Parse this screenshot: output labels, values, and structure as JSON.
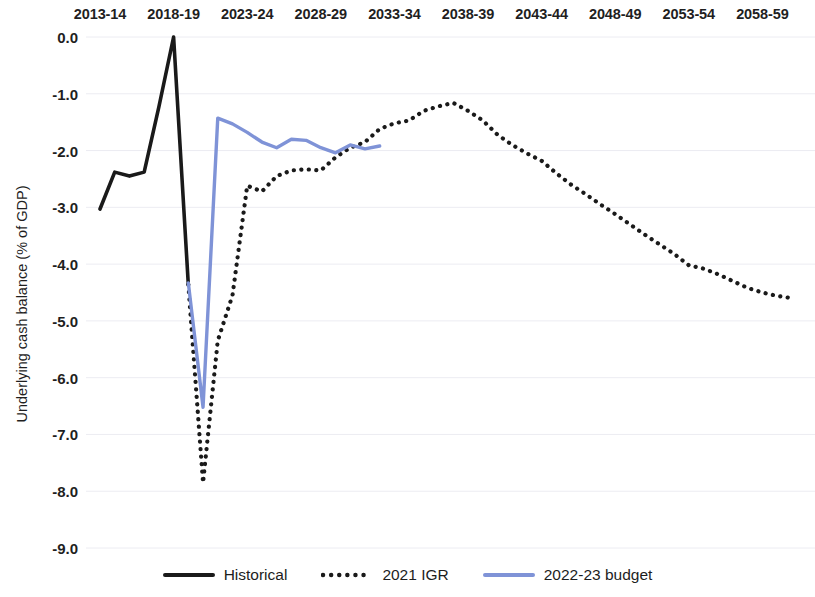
{
  "chart_data": {
    "type": "line",
    "title": "",
    "xlabel": "",
    "ylabel": "Underlying cash balance (% of GDP)",
    "ylim": [
      -9.0,
      0.0
    ],
    "xlim": [
      "2013-14",
      "2060-61"
    ],
    "grid": true,
    "legend_position": "bottom",
    "x_tick_labels": [
      "2013-14",
      "2018-19",
      "2023-24",
      "2028-29",
      "2033-34",
      "2038-39",
      "2043-44",
      "2048-49",
      "2053-54",
      "2058-59"
    ],
    "y_tick_labels": [
      "0.0",
      "-1.0",
      "-2.0",
      "-3.0",
      "-4.0",
      "-5.0",
      "-6.0",
      "-7.0",
      "-8.0",
      "-9.0"
    ],
    "y_tick_values": [
      0.0,
      -1.0,
      -2.0,
      -3.0,
      -4.0,
      -5.0,
      -6.0,
      -7.0,
      -8.0,
      -9.0
    ],
    "colors": {
      "historical": "#1a1a1a",
      "igr": "#1a1a1a",
      "budget": "#7f93d7",
      "gridline": "#ececf2",
      "text": "#1f1f1f"
    },
    "series": [
      {
        "name": "Historical",
        "style": "solid",
        "color": "#1a1a1a",
        "x": [
          "2013-14",
          "2014-15",
          "2015-16",
          "2016-17",
          "2017-18",
          "2018-19",
          "2019-20"
        ],
        "values": [
          -3.03,
          -2.38,
          -2.45,
          -2.38,
          -1.23,
          0.0,
          -4.36
        ]
      },
      {
        "name": "2021 IGR",
        "style": "dotted",
        "color": "#1a1a1a",
        "x": [
          "2019-20",
          "2020-21",
          "2021-22",
          "2022-23",
          "2023-24",
          "2024-25",
          "2025-26",
          "2026-27",
          "2027-28",
          "2028-29",
          "2029-30",
          "2030-31",
          "2031-32",
          "2032-33",
          "2033-34",
          "2034-35",
          "2035-36",
          "2036-37",
          "2037-38",
          "2038-39",
          "2039-40",
          "2040-41",
          "2041-42",
          "2042-43",
          "2043-44",
          "2044-45",
          "2045-46",
          "2046-47",
          "2047-48",
          "2048-49",
          "2049-50",
          "2050-51",
          "2051-52",
          "2052-53",
          "2053-54",
          "2054-55",
          "2055-56",
          "2056-57",
          "2057-58",
          "2058-59",
          "2059-60",
          "2060-61"
        ],
        "values": [
          -4.36,
          -7.85,
          -5.35,
          -4.55,
          -2.62,
          -2.72,
          -2.45,
          -2.35,
          -2.33,
          -2.35,
          -2.12,
          -1.95,
          -1.85,
          -1.62,
          -1.52,
          -1.47,
          -1.3,
          -1.22,
          -1.16,
          -1.3,
          -1.47,
          -1.72,
          -1.9,
          -2.05,
          -2.18,
          -2.4,
          -2.6,
          -2.77,
          -2.95,
          -3.12,
          -3.3,
          -3.48,
          -3.65,
          -3.82,
          -4.02,
          -4.08,
          -4.18,
          -4.3,
          -4.42,
          -4.5,
          -4.56,
          -4.6
        ]
      },
      {
        "name": "2022-23 budget",
        "style": "solid",
        "color": "#7f93d7",
        "x": [
          "2019-20",
          "2020-21",
          "2021-22",
          "2022-23",
          "2023-24",
          "2024-25",
          "2025-26",
          "2026-27",
          "2027-28",
          "2028-29",
          "2029-30",
          "2030-31",
          "2031-32",
          "2032-33"
        ],
        "values": [
          -4.33,
          -6.52,
          -1.43,
          -1.53,
          -1.68,
          -1.85,
          -1.95,
          -1.8,
          -1.82,
          -1.95,
          -2.04,
          -1.9,
          -1.97,
          -1.92
        ]
      }
    ]
  },
  "legend": {
    "items": [
      {
        "label": "Historical",
        "style": "solid",
        "color": "#1a1a1a",
        "icon": "solid-line-swatch"
      },
      {
        "label": "2021 IGR",
        "style": "dotted",
        "color": "#1a1a1a",
        "icon": "dotted-line-swatch"
      },
      {
        "label": "2022-23 budget",
        "style": "solid",
        "color": "#7f93d7",
        "icon": "solid-line-swatch"
      }
    ]
  }
}
